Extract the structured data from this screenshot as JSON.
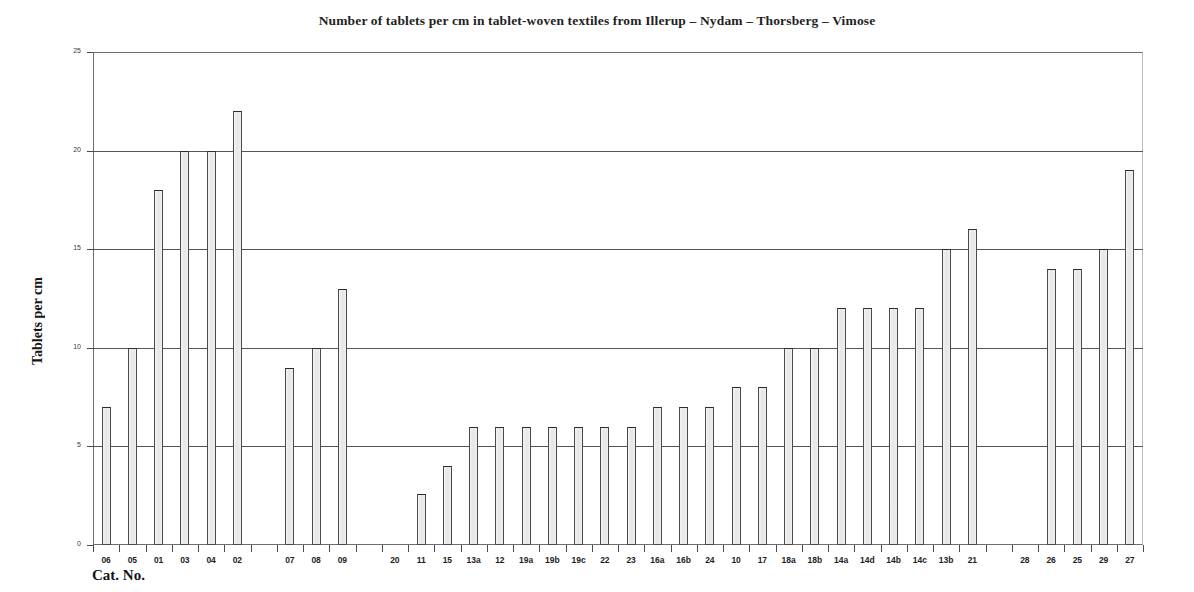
{
  "chart_data": {
    "type": "bar",
    "title": "Number of tablets per cm in tablet-woven textiles from Illerup – Nydam – Thorsberg – Vimose",
    "xlabel": "Cat. No.",
    "ylabel": "Tablets per cm",
    "ylim": [
      0,
      25
    ],
    "yticks": [
      0,
      5,
      10,
      15,
      20,
      25
    ],
    "ytick_labels": [
      "0",
      "5",
      "10",
      "15",
      "20",
      "25"
    ],
    "grid": "horizontal",
    "legend": "none",
    "categories": [
      "06",
      "05",
      "01",
      "03",
      "04",
      "02",
      "",
      "07",
      "08",
      "09",
      "",
      "20",
      "11",
      "15",
      "13a",
      "12",
      "19a",
      "19b",
      "19c",
      "22",
      "23",
      "16a",
      "16b",
      "24",
      "10",
      "17",
      "18a",
      "18b",
      "14a",
      "14d",
      "14b",
      "14c",
      "13b",
      "21",
      "",
      "28",
      "26",
      "25",
      "29",
      "27"
    ],
    "values": [
      7,
      10,
      18,
      20,
      20,
      22,
      null,
      9,
      10,
      13,
      null,
      null,
      2.6,
      4,
      6,
      6,
      6,
      6,
      6,
      6,
      6,
      7,
      7,
      7,
      8,
      8,
      10,
      10,
      12,
      12,
      12,
      12,
      15,
      16,
      null,
      null,
      14,
      14,
      15,
      19
    ],
    "bar_color": "#ececec",
    "bar_edge_color": "#4a4a4a",
    "axis_color": "#555555",
    "background": "#ffffff"
  }
}
